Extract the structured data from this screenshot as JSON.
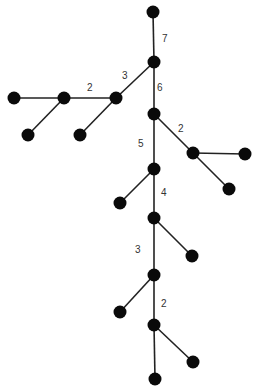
{
  "diagram": {
    "type": "tree",
    "node_color": "#0a0a0a",
    "edge_color": "#222222",
    "node_radius": 6.5,
    "nodes": [
      {
        "id": "n0",
        "x": 153,
        "y": 12
      },
      {
        "id": "n1",
        "x": 154,
        "y": 62
      },
      {
        "id": "n2",
        "x": 116,
        "y": 98
      },
      {
        "id": "n3",
        "x": 64,
        "y": 98
      },
      {
        "id": "n4",
        "x": 14,
        "y": 98
      },
      {
        "id": "n5",
        "x": 28,
        "y": 135
      },
      {
        "id": "n6",
        "x": 80,
        "y": 135
      },
      {
        "id": "n7",
        "x": 154,
        "y": 114
      },
      {
        "id": "n8",
        "x": 193,
        "y": 153
      },
      {
        "id": "n9",
        "x": 245,
        "y": 154
      },
      {
        "id": "n10",
        "x": 229,
        "y": 189
      },
      {
        "id": "n11",
        "x": 154,
        "y": 169
      },
      {
        "id": "n12",
        "x": 120,
        "y": 203
      },
      {
        "id": "n13",
        "x": 154,
        "y": 218
      },
      {
        "id": "n14",
        "x": 192,
        "y": 256
      },
      {
        "id": "n15",
        "x": 154,
        "y": 275
      },
      {
        "id": "n16",
        "x": 120,
        "y": 312
      },
      {
        "id": "n17",
        "x": 154,
        "y": 325
      },
      {
        "id": "n18",
        "x": 193,
        "y": 362
      },
      {
        "id": "n19",
        "x": 155,
        "y": 379
      }
    ],
    "edges": [
      {
        "from": "n0",
        "to": "n1",
        "label": "7",
        "lx": 162,
        "ly": 42
      },
      {
        "from": "n1",
        "to": "n2",
        "label": "3",
        "lx": 122,
        "ly": 79
      },
      {
        "from": "n2",
        "to": "n3",
        "label": "2",
        "lx": 87,
        "ly": 91
      },
      {
        "from": "n3",
        "to": "n4",
        "label": "",
        "lx": 0,
        "ly": 0
      },
      {
        "from": "n3",
        "to": "n5",
        "label": "",
        "lx": 0,
        "ly": 0
      },
      {
        "from": "n2",
        "to": "n6",
        "label": "",
        "lx": 0,
        "ly": 0
      },
      {
        "from": "n1",
        "to": "n7",
        "label": "6",
        "lx": 157,
        "ly": 91
      },
      {
        "from": "n7",
        "to": "n8",
        "label": "2",
        "lx": 178,
        "ly": 132
      },
      {
        "from": "n8",
        "to": "n9",
        "label": "",
        "lx": 0,
        "ly": 0
      },
      {
        "from": "n8",
        "to": "n10",
        "label": "",
        "lx": 0,
        "ly": 0
      },
      {
        "from": "n7",
        "to": "n11",
        "label": "5",
        "lx": 138,
        "ly": 147
      },
      {
        "from": "n11",
        "to": "n12",
        "label": "",
        "lx": 0,
        "ly": 0
      },
      {
        "from": "n11",
        "to": "n13",
        "label": "4",
        "lx": 161,
        "ly": 196
      },
      {
        "from": "n13",
        "to": "n14",
        "label": "",
        "lx": 0,
        "ly": 0
      },
      {
        "from": "n13",
        "to": "n15",
        "label": "3",
        "lx": 135,
        "ly": 253
      },
      {
        "from": "n15",
        "to": "n16",
        "label": "",
        "lx": 0,
        "ly": 0
      },
      {
        "from": "n15",
        "to": "n17",
        "label": "2",
        "lx": 161,
        "ly": 307
      },
      {
        "from": "n17",
        "to": "n18",
        "label": "",
        "lx": 0,
        "ly": 0
      },
      {
        "from": "n17",
        "to": "n19",
        "label": "",
        "lx": 0,
        "ly": 0
      }
    ]
  }
}
